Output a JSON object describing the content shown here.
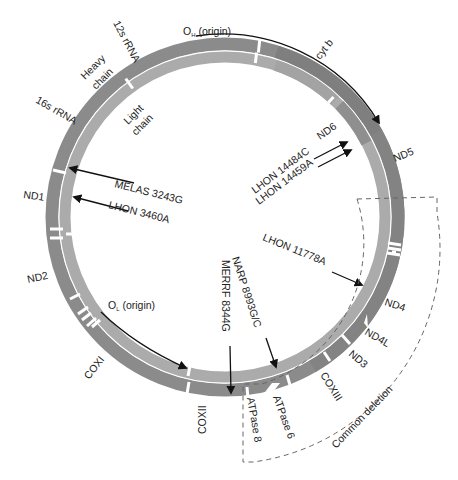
{
  "diagram": {
    "center": [
      225,
      217
    ],
    "colors": {
      "heavy_chain": "#8b8b8b",
      "heavy_chain_dark": "#7a7a7a",
      "light_chain": "#ababab",
      "light_chain_dark": "#909090",
      "separator": "#ffffff",
      "arrow": "#111111",
      "dashed": "#666666",
      "text": "#222222"
    },
    "chains": {
      "heavy": "Heavy\nchain",
      "heavy_line1": "Heavy",
      "heavy_line2": "chain",
      "light_line1": "Light",
      "light_line2": "chain"
    },
    "genes": [
      {
        "id": "12s",
        "label": "12s rRNA"
      },
      {
        "id": "16s",
        "label": "16s rRNA"
      },
      {
        "id": "nd1",
        "label": "ND1"
      },
      {
        "id": "nd2",
        "label": "ND2"
      },
      {
        "id": "coxi",
        "label": "COXI"
      },
      {
        "id": "coxii",
        "label": "COXII"
      },
      {
        "id": "atp8",
        "label": "ATPase 8"
      },
      {
        "id": "atp6",
        "label": "ATPase 6"
      },
      {
        "id": "coxiii",
        "label": "COXIII"
      },
      {
        "id": "nd3",
        "label": "ND3"
      },
      {
        "id": "nd4l",
        "label": "ND4L"
      },
      {
        "id": "nd4",
        "label": "ND4"
      },
      {
        "id": "nd5",
        "label": "ND5"
      },
      {
        "id": "nd6",
        "label": "ND6"
      },
      {
        "id": "cytb",
        "label": "cyt b"
      }
    ],
    "origins": {
      "heavy": {
        "label_main": "O",
        "label_sub": "H",
        "label_rest": " (origin)"
      },
      "light": {
        "label_main": "O",
        "label_sub": "L",
        "label_rest": " (origin)"
      }
    },
    "mutations": [
      {
        "id": "melas",
        "label": "MELAS 3243G"
      },
      {
        "id": "lhon3460",
        "label": "LHON 3460A"
      },
      {
        "id": "lhon14484",
        "label": "LHON 14484C"
      },
      {
        "id": "lhon14459",
        "label": "LHON 14459A"
      },
      {
        "id": "lhon11778",
        "label": "LHON 11778A"
      },
      {
        "id": "narp",
        "label": "NARP 8993G/C"
      },
      {
        "id": "merrf",
        "label": "MERRF 8344G"
      }
    ],
    "regions": {
      "common_deletion": "Common deletion"
    }
  }
}
